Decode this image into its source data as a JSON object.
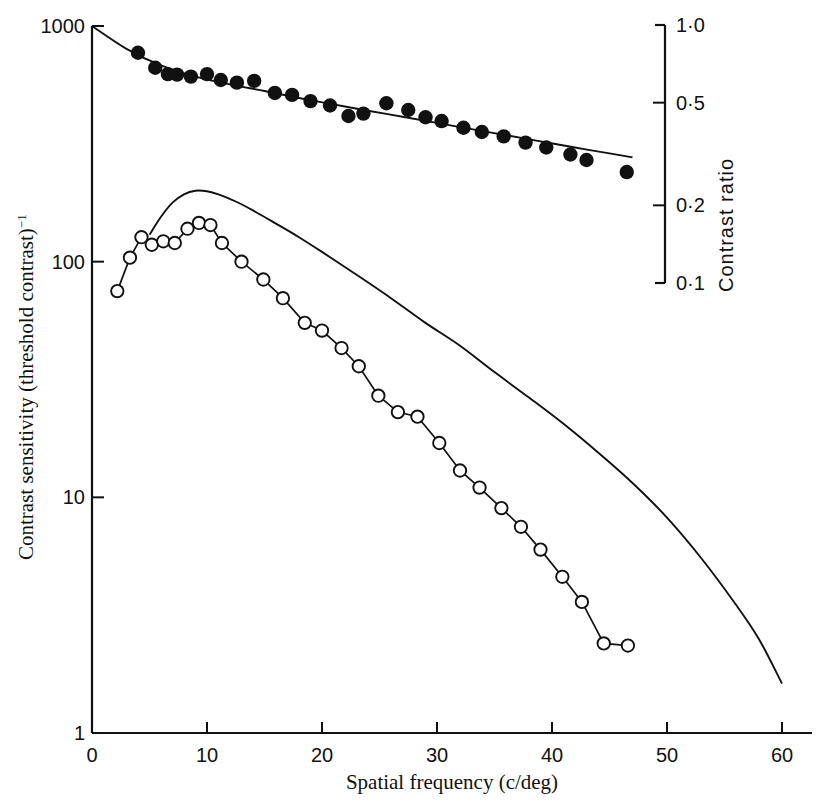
{
  "figure": {
    "background": "#ffffff",
    "ink": "#111111"
  },
  "axes": {
    "x": {
      "label": "Spatial frequency (c/deg)",
      "ticks": [
        "0",
        "10",
        "20",
        "30",
        "40",
        "50",
        "60"
      ],
      "tick_values": [
        0,
        10,
        20,
        30,
        40,
        50,
        60
      ],
      "range": [
        0,
        62
      ]
    },
    "y_left": {
      "label_main": "Contrast sensitivity (threshold contrast)",
      "label_exponent": "−1",
      "ticks": [
        "1000",
        "100",
        "10",
        "1"
      ],
      "tick_values": [
        1000,
        100,
        10,
        1
      ],
      "scale": "log",
      "range": [
        1,
        1000
      ]
    },
    "y_right": {
      "label": "Contrast ratio",
      "ticks": [
        "1·0",
        "0·5",
        "0·2",
        "0·1"
      ],
      "tick_values": [
        1.0,
        0.5,
        0.2,
        0.1
      ],
      "scale": "log",
      "range": [
        0.1,
        1.0
      ]
    }
  },
  "chart_data": {
    "type": "scatter",
    "title": "",
    "xlabel": "Spatial frequency (c/deg)",
    "ylabel": "Contrast sensitivity (threshold contrast)−1",
    "y2label": "Contrast ratio",
    "xlim": [
      0,
      62
    ],
    "ylim": [
      1,
      1000
    ],
    "y2lim": [
      0.1,
      1.0
    ],
    "xscale": "linear",
    "yscale": "log",
    "grid": false,
    "legend": "none",
    "series": [
      {
        "name": "contrast-ratio-filled-circles",
        "marker": "filled-circle",
        "axis": "right",
        "connected": false,
        "points": [
          [
            4.0,
            770
          ],
          [
            5.5,
            665
          ],
          [
            6.6,
            625
          ],
          [
            7.4,
            622
          ],
          [
            8.6,
            610
          ],
          [
            10.0,
            625
          ],
          [
            11.2,
            590
          ],
          [
            12.6,
            575
          ],
          [
            14.1,
            585
          ],
          [
            15.9,
            520
          ],
          [
            17.4,
            510
          ],
          [
            19.0,
            480
          ],
          [
            20.7,
            460
          ],
          [
            22.3,
            415
          ],
          [
            23.6,
            425
          ],
          [
            25.6,
            470
          ],
          [
            27.5,
            440
          ],
          [
            29.0,
            410
          ],
          [
            30.4,
            395
          ],
          [
            32.3,
            370
          ],
          [
            33.9,
            355
          ],
          [
            35.8,
            340
          ],
          [
            37.7,
            320
          ],
          [
            39.5,
            305
          ],
          [
            41.6,
            285
          ],
          [
            43.0,
            270
          ],
          [
            46.5,
            240
          ]
        ]
      },
      {
        "name": "contrast-sensitivity-open-circles",
        "marker": "open-circle",
        "axis": "left",
        "connected": true,
        "points": [
          [
            2.2,
            75
          ],
          [
            3.3,
            104
          ],
          [
            4.3,
            127
          ],
          [
            5.2,
            118
          ],
          [
            6.2,
            122
          ],
          [
            7.2,
            120
          ],
          [
            8.3,
            138
          ],
          [
            9.3,
            146
          ],
          [
            10.3,
            143
          ],
          [
            11.3,
            120
          ],
          [
            13.0,
            100
          ],
          [
            14.9,
            84
          ],
          [
            16.6,
            70
          ],
          [
            18.5,
            55
          ],
          [
            20.0,
            51
          ],
          [
            21.7,
            43
          ],
          [
            23.2,
            36
          ],
          [
            24.9,
            27
          ],
          [
            26.6,
            23
          ],
          [
            28.3,
            22
          ],
          [
            30.2,
            17
          ],
          [
            32.0,
            13
          ],
          [
            33.7,
            11
          ],
          [
            35.6,
            9.0
          ],
          [
            37.3,
            7.5
          ],
          [
            39.0,
            6.0
          ],
          [
            40.9,
            4.6
          ],
          [
            42.6,
            3.6
          ],
          [
            44.5,
            2.4
          ],
          [
            46.6,
            2.35
          ]
        ]
      }
    ],
    "curves": [
      {
        "name": "upper-fitted-line",
        "style": "solid",
        "axis": "right",
        "points": [
          [
            0.0,
            1000
          ],
          [
            3.0,
            800
          ],
          [
            6.0,
            680
          ],
          [
            9.0,
            610
          ],
          [
            12.0,
            565
          ],
          [
            15.0,
            530
          ],
          [
            18.0,
            495
          ],
          [
            21.0,
            465
          ],
          [
            24.0,
            437
          ],
          [
            27.0,
            412
          ],
          [
            30.0,
            388
          ],
          [
            33.0,
            365
          ],
          [
            36.0,
            344
          ],
          [
            39.0,
            324
          ],
          [
            42.0,
            305
          ],
          [
            45.0,
            288
          ],
          [
            47.0,
            277
          ]
        ]
      },
      {
        "name": "lower-theoretical-curve",
        "style": "solid",
        "axis": "left",
        "points": [
          [
            5.0,
            130
          ],
          [
            6.0,
            155
          ],
          [
            7.0,
            178
          ],
          [
            8.0,
            193
          ],
          [
            9.0,
            200
          ],
          [
            10.0,
            199
          ],
          [
            11.0,
            193
          ],
          [
            12.5,
            180
          ],
          [
            14.0,
            165
          ],
          [
            16.0,
            145
          ],
          [
            18.0,
            127
          ],
          [
            20.0,
            110
          ],
          [
            23.0,
            88
          ],
          [
            26.0,
            70
          ],
          [
            29.0,
            55
          ],
          [
            32.0,
            44
          ],
          [
            35.0,
            34
          ],
          [
            38.0,
            26.5
          ],
          [
            41.0,
            20.5
          ],
          [
            44.0,
            15.5
          ],
          [
            47.0,
            11.5
          ],
          [
            50.0,
            8.2
          ],
          [
            53.0,
            5.5
          ],
          [
            56.0,
            3.5
          ],
          [
            58.0,
            2.5
          ],
          [
            60.0,
            1.62
          ]
        ]
      }
    ]
  }
}
